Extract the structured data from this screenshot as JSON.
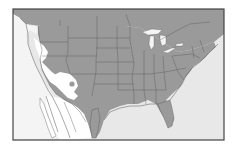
{
  "map": {
    "type": "species-range-map",
    "region": "North America (United States, southern Canada, northern Mexico)",
    "colors": {
      "range": "#9a9a9a",
      "outside_range_land": "#ffffff",
      "water": "#e8e8e8",
      "borders": "#555555",
      "frame": "#444444"
    },
    "legend": [],
    "labels": []
  }
}
